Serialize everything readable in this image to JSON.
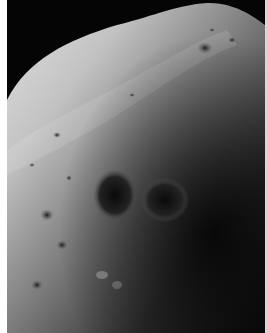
{
  "image": {
    "subject": "Grayscale close-up photograph of a cratered moon surface",
    "alt": "Cratered moon surface against black space",
    "colors": {
      "space": "#050505",
      "highlight": "#d4d4d4",
      "midtone": "#7a7a7a",
      "shadow": "#1a1a1a",
      "border": "#ffffff"
    }
  }
}
